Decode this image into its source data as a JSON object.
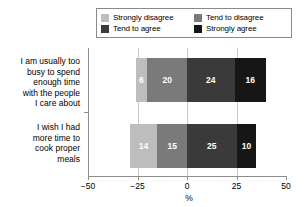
{
  "chart_data": {
    "type": "bar",
    "subtype": "diverging-stacked-horizontal",
    "title": "",
    "xlabel": "%",
    "ylabel": "",
    "xlim": [
      -50,
      50
    ],
    "xticks": [
      -50,
      -25,
      0,
      25,
      50
    ],
    "xticklabels": [
      "−50",
      "−25",
      "0",
      "25",
      "50"
    ],
    "gridlines": [
      -25,
      0,
      25
    ],
    "grid": true,
    "legend_position": "top",
    "categories": [
      "I am usually too busy to spend enough time with the people I care about",
      "I wish I had more time to cook proper meals"
    ],
    "series": [
      {
        "name": "Strongly disagree",
        "color": "#bdbdbd",
        "direction": "negative",
        "values": [
          6,
          14
        ]
      },
      {
        "name": "Tend to disagree",
        "color": "#7a7a7a",
        "direction": "negative",
        "values": [
          20,
          15
        ]
      },
      {
        "name": "Tend to agree",
        "color": "#3a3a3a",
        "direction": "positive",
        "values": [
          24,
          25
        ]
      },
      {
        "name": "Strongly agree",
        "color": "#161616",
        "direction": "positive",
        "values": [
          16,
          10
        ]
      }
    ]
  },
  "legend": {
    "items": [
      {
        "label": "Strongly disagree",
        "color": "#bdbdbd"
      },
      {
        "label": "Tend to disagree",
        "color": "#7a7a7a"
      },
      {
        "label": "Tend to agree",
        "color": "#3a3a3a"
      },
      {
        "label": "Strongly agree",
        "color": "#161616"
      }
    ]
  },
  "axis": {
    "x_title": "%",
    "tick_labels": [
      "−50",
      "−25",
      "0",
      "25",
      "50"
    ]
  },
  "category_labels": {
    "bar1_lines": [
      "I am usually too",
      "busy to spend",
      "enough time",
      "with the people",
      "I care about"
    ],
    "bar2_lines": [
      "I wish I had",
      "more time to",
      "cook proper",
      "meals"
    ]
  }
}
